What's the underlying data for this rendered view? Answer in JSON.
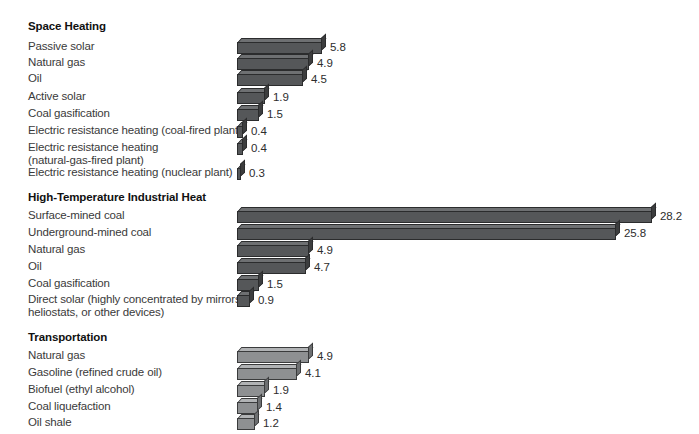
{
  "chart_data": {
    "type": "bar",
    "orientation": "horizontal",
    "title": "",
    "xlabel": "",
    "ylabel": "",
    "xlim": [
      0,
      28.2
    ],
    "grid": false,
    "legend": null,
    "unit_scale_px_per_unit": 14.7,
    "groups": [
      {
        "name": "Space Heating",
        "bar_style": "dark",
        "categories": [
          "Passive solar",
          "Natural gas",
          "Oil",
          "Active solar",
          "Coal gasification",
          "Electric resistance heating (coal-fired plant)",
          "Electric resistance heating (natural-gas-fired plant)",
          "Electric resistance heating (nuclear plant)"
        ],
        "values": [
          5.8,
          4.9,
          4.5,
          1.9,
          1.5,
          0.4,
          0.4,
          0.3
        ]
      },
      {
        "name": "High-Temperature Industrial Heat",
        "bar_style": "dark",
        "categories": [
          "Surface-mined coal",
          "Underground-mined coal",
          "Natural gas",
          "Oil",
          "Coal gasification",
          "Direct solar (highly concentrated by mirrors, heliostats, or other devices)"
        ],
        "values": [
          28.2,
          25.8,
          4.9,
          4.7,
          1.5,
          0.9
        ]
      },
      {
        "name": "Transportation",
        "bar_style": "light",
        "categories": [
          "Natural gas",
          "Gasoline (refined crude oil)",
          "Biofuel (ethyl alcohol)",
          "Coal liquefaction",
          "Oil shale"
        ],
        "values": [
          4.9,
          4.1,
          1.9,
          1.4,
          1.2
        ]
      }
    ]
  },
  "sections": [
    {
      "title": "Space Heating",
      "title_top": 20,
      "style": "dark",
      "rows": [
        {
          "label_line1": "Passive solar",
          "label_line2": "",
          "value": "5.8",
          "value_num": 5.8,
          "top": 38
        },
        {
          "label_line1": "Natural gas",
          "label_line2": "",
          "value": "4.9",
          "value_num": 4.9,
          "top": 54
        },
        {
          "label_line1": "Oil",
          "label_line2": "",
          "value": "4.5",
          "value_num": 4.5,
          "top": 70
        },
        {
          "label_line1": "Active solar",
          "label_line2": "",
          "value": "1.9",
          "value_num": 1.9,
          "top": 88
        },
        {
          "label_line1": "Coal gasification",
          "label_line2": "",
          "value": "1.5",
          "value_num": 1.5,
          "top": 105
        },
        {
          "label_line1": "Electric resistance heating (coal-fired plant)",
          "label_line2": "",
          "value": "0.4",
          "value_num": 0.4,
          "top": 122
        },
        {
          "label_line1": "Electric resistance heating",
          "label_line2": "(natural-gas-fired plant)",
          "value": "0.4",
          "value_num": 0.4,
          "top": 139
        },
        {
          "label_line1": "Electric resistance heating (nuclear plant)",
          "label_line2": "",
          "value": "0.3",
          "value_num": 0.3,
          "top": 164
        }
      ]
    },
    {
      "title": "High-Temperature Industrial Heat",
      "title_top": 191,
      "style": "dark",
      "rows": [
        {
          "label_line1": "Surface-mined coal",
          "label_line2": "",
          "value": "28.2",
          "value_num": 28.2,
          "top": 207
        },
        {
          "label_line1": "Underground-mined coal",
          "label_line2": "",
          "value": "25.8",
          "value_num": 25.8,
          "top": 224
        },
        {
          "label_line1": "Natural gas",
          "label_line2": "",
          "value": "4.9",
          "value_num": 4.9,
          "top": 241
        },
        {
          "label_line1": "Oil",
          "label_line2": "",
          "value": "4.7",
          "value_num": 4.7,
          "top": 258
        },
        {
          "label_line1": "Coal gasification",
          "label_line2": "",
          "value": "1.5",
          "value_num": 1.5,
          "top": 275
        },
        {
          "label_line1": "Direct solar (highly concentrated by mirrors,",
          "label_line2": "heliostats, or other devices)",
          "value": "0.9",
          "value_num": 0.9,
          "top": 291
        }
      ]
    },
    {
      "title": "Transportation",
      "title_top": 331,
      "style": "light",
      "rows": [
        {
          "label_line1": "Natural gas",
          "label_line2": "",
          "value": "4.9",
          "value_num": 4.9,
          "top": 347
        },
        {
          "label_line1": "Gasoline (refined crude oil)",
          "label_line2": "",
          "value": "4.1",
          "value_num": 4.1,
          "top": 364
        },
        {
          "label_line1": "Biofuel (ethyl alcohol)",
          "label_line2": "",
          "value": "1.9",
          "value_num": 1.9,
          "top": 381
        },
        {
          "label_line1": "Coal liquefaction",
          "label_line2": "",
          "value": "1.4",
          "value_num": 1.4,
          "top": 398
        },
        {
          "label_line1": "Oil shale",
          "label_line2": "",
          "value": "1.2",
          "value_num": 1.2,
          "top": 414
        }
      ]
    }
  ],
  "colors": {
    "bar_dark_front": "#555759",
    "bar_dark_top": "#6e7072",
    "bar_dark_side": "#3c3d3e",
    "bar_light_front": "#8e9092",
    "bar_light_top": "#b1b3b5",
    "bar_light_side": "#6d6f71",
    "outline": "#2b2c2d",
    "label_text": "#3a3a3a",
    "title_text": "#111111",
    "background": "#ffffff"
  },
  "geometry": {
    "bar_origin_x": 233,
    "bar_body_offset_x": 4,
    "px_per_unit": 14.7,
    "value_gap_px": 8
  }
}
